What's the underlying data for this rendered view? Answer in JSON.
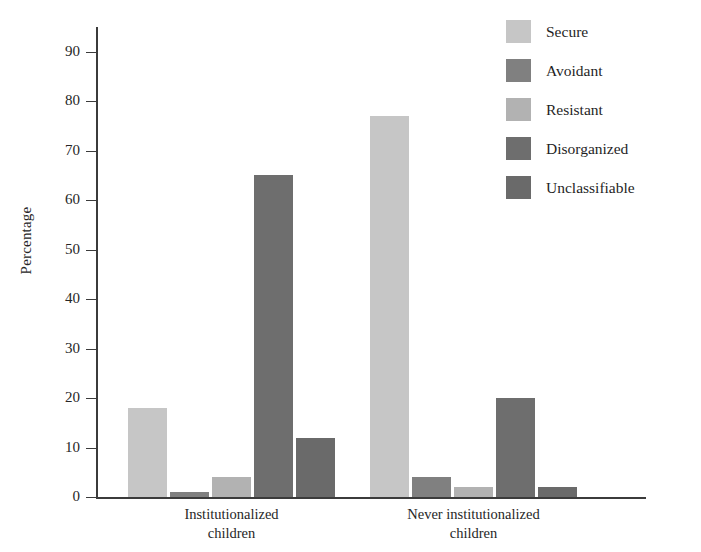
{
  "chart_data": {
    "type": "bar",
    "title": "",
    "xlabel": "",
    "ylabel": "Percentage",
    "ylim": [
      0,
      95
    ],
    "yticks": [
      0,
      10,
      20,
      30,
      40,
      50,
      60,
      70,
      80,
      90
    ],
    "ytick_labels": [
      "0",
      "10",
      "20",
      "30",
      "40",
      "50",
      "60",
      "70",
      "80",
      "90"
    ],
    "grid": false,
    "legend_position": "top-right",
    "categories": [
      "Institutionalized children",
      "Never institutionalized children"
    ],
    "category_lines": [
      [
        "Institutionalized",
        "children"
      ],
      [
        "Never institutionalized",
        "children"
      ]
    ],
    "series": [
      {
        "name": "Secure",
        "color": "#c6c6c6",
        "values": [
          18,
          77
        ]
      },
      {
        "name": "Avoidant",
        "color": "#808080",
        "values": [
          1,
          4
        ]
      },
      {
        "name": "Resistant",
        "color": "#b2b2b2",
        "values": [
          4,
          2
        ]
      },
      {
        "name": "Disorganized",
        "color": "#6e6e6e",
        "values": [
          65,
          20
        ]
      },
      {
        "name": "Unclassifiable",
        "color": "#6a6a6a",
        "values": [
          12,
          2
        ]
      }
    ]
  },
  "axis": {
    "y_title": "Percentage"
  },
  "legend": {
    "items": [
      {
        "label": "Secure"
      },
      {
        "label": "Avoidant"
      },
      {
        "label": "Resistant"
      },
      {
        "label": "Disorganized"
      },
      {
        "label": "Unclassifiable"
      }
    ]
  },
  "caption_fragment": ""
}
